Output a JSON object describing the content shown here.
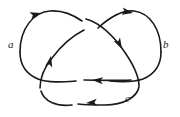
{
  "figure": {
    "name": "oriented-trefoil-knot-diagram",
    "type": "knot-diagram",
    "background_color": "#ffffff",
    "stroke_color": "#1a1a1a",
    "stroke_width": 1.6,
    "width": 180,
    "height": 117,
    "crossings": 3,
    "labels": [
      {
        "id": "a",
        "text": "a",
        "x": 8,
        "y": 39
      },
      {
        "id": "b",
        "text": "b",
        "x": 163,
        "y": 39
      },
      {
        "id": "c",
        "text": "c",
        "x": 125,
        "y": 93
      }
    ],
    "arrow_count": 6,
    "arrows": [
      {
        "id": "arrow-top-left",
        "x": 41,
        "y": 13,
        "angle": -15
      },
      {
        "id": "arrow-top-right",
        "x": 133,
        "y": 13,
        "angle": 10
      },
      {
        "id": "arrow-mid-right",
        "x": 122,
        "y": 49,
        "angle": 62
      },
      {
        "id": "arrow-mid-left",
        "x": 51,
        "y": 56,
        "angle": -78
      },
      {
        "id": "arrow-bottom-mid",
        "x": 92,
        "y": 80,
        "angle": 184
      },
      {
        "id": "arrow-bottom-low",
        "x": 86,
        "y": 103,
        "angle": 176
      }
    ],
    "strands": [
      {
        "id": "strand-upper-left-lobe",
        "d": "M 20 52 C 20 28, 34 12, 50 11 C 62 10, 72 14, 82 21"
      },
      {
        "id": "strand-upper-right-lobe",
        "d": "M 98 28 C 110 17, 122 10, 134 11 C 150 13, 161 29, 161 52"
      },
      {
        "id": "strand-right-descend",
        "d": "M 86 19 C 100 23, 114 36, 126 54 C 134 66, 139 76, 139 86"
      },
      {
        "id": "strand-left-ascend",
        "d": "M 40 88 C 40 78, 44 68, 52 58 C 61 46, 72 36, 84 30"
      },
      {
        "id": "strand-left-outer-down",
        "d": "M 20 52 C 20 64, 26 74, 38 79 C 48 83, 62 82, 76 81"
      },
      {
        "id": "strand-right-outer-down",
        "d": "M 161 52 C 161 64, 155 74, 143 79 C 134 82, 122 82, 110 81"
      },
      {
        "id": "strand-horizontal-mid",
        "d": "M 131 80 C 115 81, 100 80, 84 80"
      },
      {
        "id": "strand-bottom-left-arc",
        "d": "M 41 91 C 44 101, 56 107, 72 105"
      },
      {
        "id": "strand-bottom-right-arc",
        "d": "M 139 87 C 137 97, 124 105, 105 105 C 95 105, 86 105, 78 104"
      }
    ]
  }
}
